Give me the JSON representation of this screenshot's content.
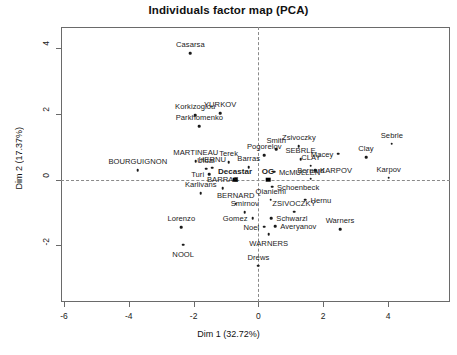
{
  "chart_data": {
    "type": "scatter",
    "title": "Individuals factor map (PCA)",
    "xlabel": "Dim 1 (32.72%)",
    "ylabel": "Dim 2 (17.37%)",
    "xlim": [
      -6.9,
      5.2
    ],
    "ylim": [
      -3.1,
      4.7
    ],
    "xticks": [
      -6,
      -4,
      -2,
      0,
      2,
      4
    ],
    "xticklabels": [
      "-6",
      "-4",
      "-2",
      "0",
      "2",
      "4"
    ],
    "yticks": [
      -2,
      0,
      2,
      4
    ],
    "yticklabels": [
      "-2",
      "0",
      "2",
      "4"
    ],
    "grid": false,
    "legend": null,
    "reference_lines": {
      "vertical_at_x": 0,
      "horizontal_at_y": 0,
      "style": "dashed"
    },
    "points": [
      {
        "label": "Casarsa",
        "x": -2.1,
        "y": 3.85,
        "label_pos": "top",
        "bold": false,
        "marker": "circle"
      },
      {
        "label": "Korkizoglou",
        "x": -1.95,
        "y": 1.95,
        "label_pos": "top",
        "bold": false,
        "marker": "circle"
      },
      {
        "label": "YURKOV",
        "x": -1.18,
        "y": 2.02,
        "label_pos": "top",
        "bold": false,
        "marker": "circle"
      },
      {
        "label": "Parkhomenko",
        "x": -1.82,
        "y": 1.62,
        "label_pos": "top",
        "bold": false,
        "marker": "circle"
      },
      {
        "label": "Zsivoczky",
        "x": 1.25,
        "y": 1.02,
        "label_pos": "top",
        "bold": false,
        "marker": "circle"
      },
      {
        "label": "Sebrle",
        "x": 4.12,
        "y": 1.09,
        "label_pos": "top",
        "bold": false,
        "marker": "circle"
      },
      {
        "label": "Smith",
        "x": 0.55,
        "y": 0.92,
        "label_pos": "top",
        "bold": false,
        "marker": "circle"
      },
      {
        "label": "Macey",
        "x": 2.47,
        "y": 0.78,
        "label_pos": "left",
        "bold": false,
        "marker": "circle"
      },
      {
        "label": "Clay",
        "x": 3.32,
        "y": 0.68,
        "label_pos": "top",
        "bold": false,
        "marker": "circle"
      },
      {
        "label": "Pogorelov",
        "x": 0.18,
        "y": 0.74,
        "label_pos": "top",
        "bold": false,
        "marker": "circle"
      },
      {
        "label": "SEBRLE",
        "x": 1.3,
        "y": 0.62,
        "label_pos": "top",
        "bold": false,
        "marker": "circle"
      },
      {
        "label": "MARTINEAU",
        "x": -1.93,
        "y": 0.56,
        "label_pos": "top",
        "bold": false,
        "marker": "circle"
      },
      {
        "label": "Terek",
        "x": -0.92,
        "y": 0.52,
        "label_pos": "top",
        "bold": false,
        "marker": "circle"
      },
      {
        "label": "CLAY",
        "x": 1.62,
        "y": 0.42,
        "label_pos": "top",
        "bold": false,
        "marker": "circle"
      },
      {
        "label": "KARPOV",
        "x": 1.75,
        "y": 0.28,
        "label_pos": "right",
        "bold": false,
        "marker": "circle"
      },
      {
        "label": "HERNU",
        "x": -1.42,
        "y": 0.36,
        "label_pos": "top",
        "bold": false,
        "marker": "circle"
      },
      {
        "label": "Barras",
        "x": -0.3,
        "y": 0.38,
        "label_pos": "top",
        "bold": false,
        "marker": "circle"
      },
      {
        "label": "Uldal",
        "x": -1.62,
        "y": 0.33,
        "label_pos": "top",
        "bold": false,
        "marker": "circle"
      },
      {
        "label": "BOURGUIGNON",
        "x": -3.72,
        "y": 0.28,
        "label_pos": "top",
        "bold": false,
        "marker": "circle"
      },
      {
        "label": "McMULLEN",
        "x": 0.48,
        "y": 0.24,
        "label_pos": "right",
        "bold": false,
        "marker": "circle"
      },
      {
        "label": "Turi",
        "x": -1.52,
        "y": 0.16,
        "label_pos": "left",
        "bold": false,
        "marker": "circle"
      },
      {
        "label": "Karpov",
        "x": 4.02,
        "y": 0.05,
        "label_pos": "top",
        "bold": false,
        "marker": "circle"
      },
      {
        "label": "Bernard",
        "x": 1.62,
        "y": 0.02,
        "label_pos": "top",
        "bold": false,
        "marker": "circle"
      },
      {
        "label": "Decastar",
        "x": -0.72,
        "y": 0.0,
        "label_pos": "top",
        "bold": true,
        "marker": "square"
      },
      {
        "label": "OG",
        "x": 0.3,
        "y": 0.0,
        "label_pos": "top",
        "bold": true,
        "marker": "square"
      },
      {
        "label": "Schoenbeck",
        "x": 0.42,
        "y": -0.22,
        "label_pos": "right",
        "bold": false,
        "marker": "circle"
      },
      {
        "label": "BARRAS",
        "x": -1.1,
        "y": -0.26,
        "label_pos": "top",
        "bold": false,
        "marker": "circle"
      },
      {
        "label": "Karlivans",
        "x": -1.78,
        "y": -0.42,
        "label_pos": "top",
        "bold": false,
        "marker": "circle"
      },
      {
        "label": "Qianiemi",
        "x": 0.38,
        "y": -0.62,
        "label_pos": "top",
        "bold": false,
        "marker": "circle"
      },
      {
        "label": "Hernu",
        "x": 1.45,
        "y": -0.62,
        "label_pos": "right",
        "bold": false,
        "marker": "circle"
      },
      {
        "label": "BERNARD",
        "x": -0.7,
        "y": -0.74,
        "label_pos": "top",
        "bold": false,
        "marker": "circle"
      },
      {
        "label": "Smirnov",
        "x": -0.42,
        "y": -1.0,
        "label_pos": "top",
        "bold": false,
        "marker": "circle"
      },
      {
        "label": "ZSIVOCZKY",
        "x": 1.1,
        "y": -0.98,
        "label_pos": "top",
        "bold": false,
        "marker": "circle"
      },
      {
        "label": "Gomez",
        "x": -0.18,
        "y": -1.18,
        "label_pos": "left",
        "bold": false,
        "marker": "circle"
      },
      {
        "label": "Schwarzl",
        "x": 0.4,
        "y": -1.18,
        "label_pos": "right",
        "bold": false,
        "marker": "circle"
      },
      {
        "label": "Lorenzo",
        "x": -2.38,
        "y": -1.46,
        "label_pos": "top",
        "bold": false,
        "marker": "circle"
      },
      {
        "label": "Noel",
        "x": 0.18,
        "y": -1.44,
        "label_pos": "left",
        "bold": false,
        "marker": "circle"
      },
      {
        "label": "Averyanov",
        "x": 0.52,
        "y": -1.42,
        "label_pos": "right",
        "bold": false,
        "marker": "circle"
      },
      {
        "label": "Warners",
        "x": 2.52,
        "y": -1.52,
        "label_pos": "top",
        "bold": false,
        "marker": "circle"
      },
      {
        "label": "WARNERS",
        "x": 0.32,
        "y": -1.66,
        "label_pos": "bottom",
        "bold": false,
        "marker": "circle"
      },
      {
        "label": "NOOL",
        "x": -2.32,
        "y": -1.98,
        "label_pos": "bottom",
        "bold": false,
        "marker": "circle"
      },
      {
        "label": "Drews",
        "x": 0.0,
        "y": -2.62,
        "label_pos": "top",
        "bold": false,
        "marker": "circle"
      }
    ]
  }
}
